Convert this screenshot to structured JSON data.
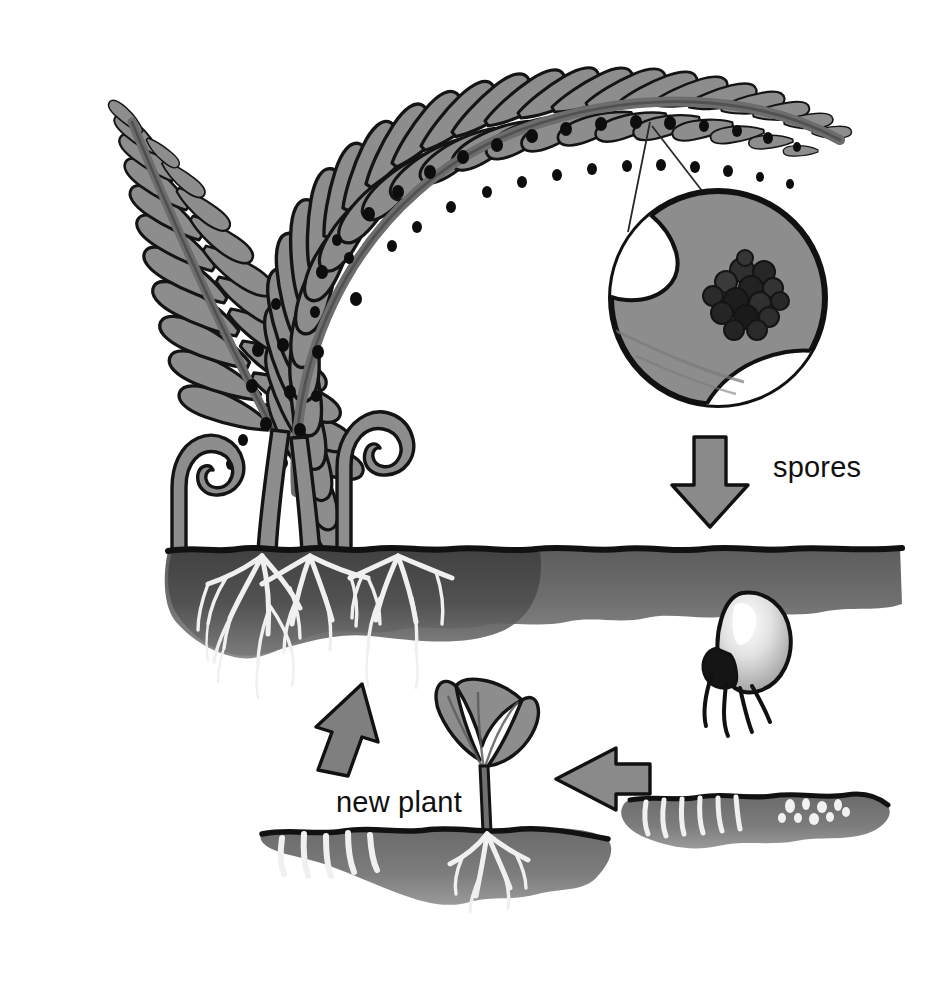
{
  "diagram": {
    "background_color": "#ffffff",
    "ink_color": "#111111",
    "frond_fill": "#8d8d8d",
    "frond_fill_dark": "#7d7d7d",
    "soil_fill": "#6f6f6f",
    "soil_fill_dark": "#4a4a4a",
    "soil_edge_color": "#1a1a1a",
    "root_color": "#f2f2f2",
    "arrow_fill": "#8a8a8a",
    "arrow_stroke": "#111111",
    "spore_dot_color": "#0d0d0d",
    "sporangia_color": "#2a2a2a",
    "germ_spore_fill": "#d8d8d8",
    "germ_spore_shadow": "#9a9a9a"
  },
  "labels": [
    {
      "id": "spores-label",
      "text": "spores",
      "x": 773,
      "y": 477,
      "anchor": "start",
      "font_size": 29
    },
    {
      "id": "new-plant-label",
      "text": "new plant",
      "x": 336,
      "y": 812,
      "anchor": "start",
      "font_size": 29
    }
  ],
  "stages": [
    {
      "id": "adult-fern",
      "name": "adult fern sporophyte",
      "description": "Mature fern with arching fronds bearing sori, fiddleheads and roots in soil"
    },
    {
      "id": "sorus-magnifier",
      "name": "magnified sorus",
      "description": "Circular magnifier showing a cluster of dark sporangia on the underside of a pinna",
      "circle": {
        "cx": 718,
        "cy": 298,
        "r": 109
      }
    },
    {
      "id": "spore-release",
      "name": "spores released",
      "description": "Spores fall from the sorus to the ground"
    },
    {
      "id": "germinating-spore",
      "name": "germinating spore",
      "description": "Spore with rhizoids germinating below the soil surface"
    },
    {
      "id": "gametophyte",
      "name": "gametophyte prothallus",
      "description": "Heart-shaped prothallus growing in soil with rhizoids"
    },
    {
      "id": "new-plant",
      "name": "new plant sporeling",
      "description": "Young fern sporeling with two lobed leaves and roots"
    }
  ],
  "arrows": [
    {
      "id": "arrow-spores-down",
      "direction": "down",
      "from": "sorus-magnifier",
      "to": "germinating-spore"
    },
    {
      "id": "arrow-gametophyte-left",
      "direction": "left",
      "from": "gametophyte",
      "to": "new-plant"
    },
    {
      "id": "arrow-new-plant-up",
      "direction": "up-left",
      "from": "new-plant",
      "to": "adult-fern"
    }
  ],
  "sori_count_on_frond": 44
}
